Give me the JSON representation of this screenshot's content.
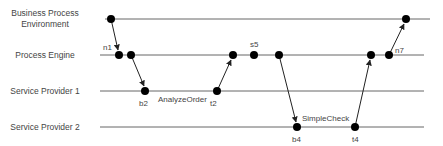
{
  "diagram": {
    "type": "sequence-timeline",
    "lanes": [
      {
        "id": "bpe",
        "label_line1": "Business Process",
        "label_line2": "Environment",
        "y": 19,
        "x1": 105,
        "x2": 430
      },
      {
        "id": "pe",
        "label_line1": "Process Engine",
        "label_line2": "",
        "y": 55,
        "x1": 100,
        "x2": 424
      },
      {
        "id": "sp1",
        "label_line1": "Service Provider 1",
        "label_line2": "",
        "y": 91,
        "x1": 100,
        "x2": 424
      },
      {
        "id": "sp2",
        "label_line1": "Service Provider 2",
        "label_line2": "",
        "y": 127,
        "x1": 100,
        "x2": 424
      }
    ],
    "nodes": [
      {
        "id": "bpe-start",
        "x": 111,
        "y": 19,
        "label": ""
      },
      {
        "id": "n1",
        "x": 119,
        "y": 55,
        "label": "n1"
      },
      {
        "id": "pe-2",
        "x": 131,
        "y": 55,
        "label": ""
      },
      {
        "id": "b2",
        "x": 145,
        "y": 91,
        "label": "b2"
      },
      {
        "id": "t2",
        "x": 217,
        "y": 91,
        "label": "t2"
      },
      {
        "id": "pe-3",
        "x": 233,
        "y": 55,
        "label": ""
      },
      {
        "id": "s5",
        "x": 254,
        "y": 55,
        "label": "s5"
      },
      {
        "id": "pe-5",
        "x": 279,
        "y": 55,
        "label": ""
      },
      {
        "id": "b4",
        "x": 297,
        "y": 127,
        "label": "b4"
      },
      {
        "id": "t4",
        "x": 355,
        "y": 127,
        "label": "t4"
      },
      {
        "id": "pe-6",
        "x": 371,
        "y": 55,
        "label": ""
      },
      {
        "id": "n7",
        "x": 389,
        "y": 55,
        "label": "n7"
      },
      {
        "id": "bpe-end",
        "x": 406,
        "y": 19,
        "label": ""
      }
    ],
    "activities": [
      {
        "label": "AnalyzeOrder",
        "x": 181,
        "y": 100
      },
      {
        "label": "SimpleCheck",
        "x": 325,
        "y": 120
      }
    ],
    "colors": {
      "line": "#555555",
      "node": "#000000",
      "text": "#444444"
    }
  },
  "labels": {
    "n1": "n1",
    "b2": "b2",
    "t2": "t2",
    "s5": "s5",
    "b4": "b4",
    "t4": "t4",
    "n7": "n7",
    "analyze_order": "AnalyzeOrder",
    "simple_check": "SimpleCheck",
    "lane_bpe_1": "Business Process",
    "lane_bpe_2": "Environment",
    "lane_pe": "Process Engine",
    "lane_sp1": "Service Provider 1",
    "lane_sp2": "Service Provider 2"
  }
}
